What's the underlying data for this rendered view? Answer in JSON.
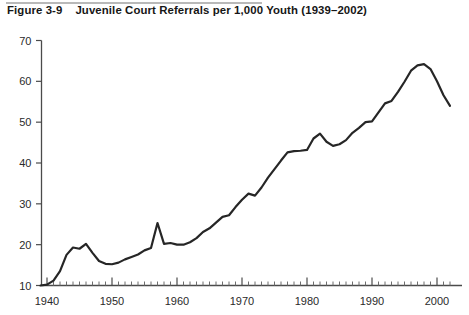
{
  "figure": {
    "number": "Figure 3-9",
    "title": "Juvenile Court Referrals per 1,000 Youth (1939–2002)"
  },
  "chart_data": {
    "type": "line",
    "title": "Juvenile Court Referrals per 1,000 Youth (1939–2002)",
    "xlabel": "",
    "ylabel": "",
    "xlim": [
      1939,
      2002
    ],
    "ylim": [
      10,
      70
    ],
    "y_ticks": [
      10,
      20,
      30,
      40,
      50,
      60,
      70
    ],
    "x_ticks": [
      1940,
      1950,
      1960,
      1970,
      1980,
      1990,
      2000
    ],
    "x_minor_tick_interval": 1,
    "grid": false,
    "legend": false,
    "line_color": "#262626",
    "series": [
      {
        "name": "Juvenile court referrals per 1,000 youth",
        "x": [
          1939,
          1940,
          1941,
          1942,
          1943,
          1944,
          1945,
          1946,
          1947,
          1948,
          1949,
          1950,
          1951,
          1952,
          1953,
          1954,
          1955,
          1956,
          1957,
          1958,
          1959,
          1960,
          1961,
          1962,
          1963,
          1964,
          1965,
          1966,
          1967,
          1968,
          1969,
          1970,
          1971,
          1972,
          1973,
          1974,
          1975,
          1976,
          1977,
          1978,
          1979,
          1980,
          1981,
          1982,
          1983,
          1984,
          1985,
          1986,
          1987,
          1988,
          1989,
          1990,
          1991,
          1992,
          1993,
          1994,
          1995,
          1996,
          1997,
          1998,
          1999,
          2000,
          2001,
          2002
        ],
        "y": [
          10.0,
          10.2,
          11.2,
          13.5,
          17.5,
          19.3,
          19.0,
          20.2,
          18.0,
          16.0,
          15.3,
          15.2,
          15.6,
          16.4,
          17.0,
          17.6,
          18.6,
          19.2,
          25.3,
          20.2,
          20.4,
          20.0,
          20.0,
          20.6,
          21.6,
          23.1,
          24.0,
          25.4,
          26.8,
          27.2,
          29.2,
          31.0,
          32.5,
          32.0,
          34.0,
          36.4,
          38.5,
          40.6,
          42.6,
          42.9,
          43.0,
          43.2,
          46.0,
          47.2,
          45.2,
          44.2,
          44.6,
          45.6,
          47.4,
          48.6,
          50.0,
          50.2,
          52.4,
          54.6,
          55.2,
          57.4,
          59.9,
          62.6,
          63.9,
          64.2,
          63.0,
          60.0,
          56.6,
          54.0
        ]
      }
    ]
  }
}
